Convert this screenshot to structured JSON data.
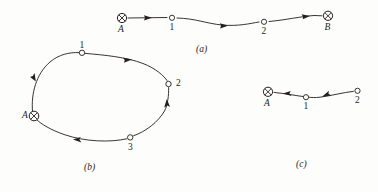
{
  "figure": {
    "background_color": "#fdfdfb",
    "ink_color": "#231f1c",
    "panels": [
      {
        "id": "a",
        "caption": "(a)",
        "description": "open chain from source A through nodes 1 and 2 to sink B",
        "nodes": [
          {
            "label": "A",
            "type": "terminal",
            "x": 122,
            "y": 18
          },
          {
            "label": "1",
            "type": "open",
            "x": 172,
            "y": 18
          },
          {
            "label": "2",
            "type": "open",
            "x": 264,
            "y": 22
          },
          {
            "label": "B",
            "type": "terminal",
            "x": 328,
            "y": 16
          }
        ],
        "edges": [
          {
            "from": "A",
            "to": "1",
            "direction": "right"
          },
          {
            "from": "1",
            "to": "2",
            "direction": "right"
          },
          {
            "from": "2",
            "to": "B",
            "direction": "right"
          }
        ]
      },
      {
        "id": "b",
        "caption": "(b)",
        "description": "closed loop through A, 1, 2, 3",
        "nodes": [
          {
            "label": "A",
            "type": "terminal",
            "x": 34,
            "y": 116
          },
          {
            "label": "1",
            "type": "open",
            "x": 82,
            "y": 53
          },
          {
            "label": "2",
            "type": "open",
            "x": 168,
            "y": 84
          },
          {
            "label": "3",
            "type": "open",
            "x": 130,
            "y": 138
          }
        ],
        "edges": [
          {
            "from": "A",
            "to": "1",
            "direction": "up"
          },
          {
            "from": "1",
            "to": "2",
            "direction": "right"
          },
          {
            "from": "3",
            "to": "2",
            "direction": "up"
          },
          {
            "from": "3",
            "to": "A",
            "direction": "left"
          }
        ]
      },
      {
        "id": "c",
        "caption": "(c)",
        "description": "open chain flowing from node 2 through node 1 into sink A",
        "nodes": [
          {
            "label": "A",
            "type": "terminal",
            "x": 268,
            "y": 92
          },
          {
            "label": "1",
            "type": "open",
            "x": 306,
            "y": 97
          },
          {
            "label": "2",
            "type": "open",
            "x": 358,
            "y": 91
          }
        ],
        "edges": [
          {
            "from": "1",
            "to": "A",
            "direction": "left"
          },
          {
            "from": "2",
            "to": "1",
            "direction": "left"
          }
        ]
      }
    ],
    "labels": {
      "a_node_A": "A",
      "a_node_1": "1",
      "a_node_2": "2",
      "a_node_B": "B",
      "b_node_A": "A",
      "b_node_1": "1",
      "b_node_2": "2",
      "b_node_3": "3",
      "c_node_A": "A",
      "c_node_1": "1",
      "c_node_2": "2",
      "caption_a": "(a)",
      "caption_b": "(b)",
      "caption_c": "(c)"
    }
  }
}
